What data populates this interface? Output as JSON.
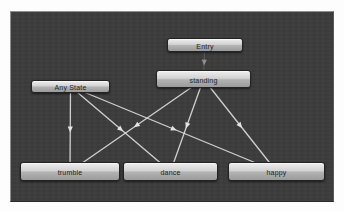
{
  "diagram": {
    "kind": "state-machine",
    "panel": {
      "x": 10,
      "y": 11,
      "w": 324,
      "h": 191
    },
    "colors": {
      "page_bg": "#fdfdfd",
      "panel_bg": "#3b3b3b",
      "panel_border": "#8d8d8d",
      "node_fill_top": "#eeeeee",
      "node_fill_bottom": "#9b9b9b",
      "node_border": "#232323",
      "node_label": "#1d1d1d",
      "edge": "#e4e4e4",
      "entry_edge": "#5d5d5d",
      "entry_arrow": "#8f8f8f"
    },
    "nodes": [
      {
        "id": "entry",
        "label": "Entry",
        "x": 167,
        "y": 38,
        "w": 76,
        "h": 14
      },
      {
        "id": "standing",
        "label": "standing",
        "x": 156,
        "y": 70,
        "w": 95,
        "h": 18
      },
      {
        "id": "any-state",
        "label": "Any State",
        "x": 31,
        "y": 80,
        "w": 79,
        "h": 13
      },
      {
        "id": "trumble",
        "label": "trumble",
        "x": 20,
        "y": 162,
        "w": 100,
        "h": 19
      },
      {
        "id": "dance",
        "label": "dance",
        "x": 123,
        "y": 162,
        "w": 95,
        "h": 19
      },
      {
        "id": "happy",
        "label": "happy",
        "x": 228,
        "y": 162,
        "w": 97,
        "h": 19
      }
    ],
    "edges": [
      {
        "from": "entry",
        "to": "standing",
        "style": "entry"
      },
      {
        "from": "any-state",
        "to": "trumble",
        "style": "normal"
      },
      {
        "from": "any-state",
        "to": "dance",
        "style": "normal"
      },
      {
        "from": "any-state",
        "to": "happy",
        "style": "normal"
      },
      {
        "from": "standing",
        "to": "trumble",
        "style": "normal"
      },
      {
        "from": "standing",
        "to": "dance",
        "style": "normal"
      },
      {
        "from": "standing",
        "to": "happy",
        "style": "normal"
      }
    ]
  }
}
